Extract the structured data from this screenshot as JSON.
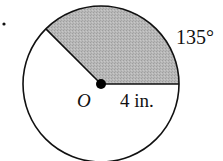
{
  "figure": {
    "item_marker": ".",
    "center_label": "O",
    "radius_label": "4 in.",
    "angle_label": "135°",
    "circle": {
      "radius_in": 4,
      "sector_angle_deg": 135,
      "shaded_region": "sector from 0° to 135° (counterclockwise from the right-pointing radius)"
    },
    "colors": {
      "outline": "#111111",
      "shading": "#b5b5b5",
      "background": "#ffffff"
    }
  }
}
